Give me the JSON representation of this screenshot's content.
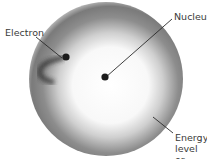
{
  "diagram": {
    "type": "atom-model",
    "labels": {
      "electron": "Electron",
      "nucleus": "Nucleus",
      "shell": "Energy\nlevel or\nshell"
    },
    "colors": {
      "shell_outer": "#6e6e6e",
      "shell_inner": "#ffffff",
      "nucleus": "#1c1c1c",
      "electron": "#1c1c1c",
      "leader_line": "#2a2a2a",
      "text": "#3a3a3a"
    }
  }
}
